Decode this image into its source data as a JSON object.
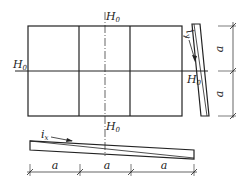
{
  "diagram": {
    "type": "drainage-slope-plan",
    "labels": {
      "axis_top": "H",
      "axis_top_sub": "0",
      "axis_left": "H",
      "axis_left_sub": "0",
      "axis_right": "H",
      "axis_right_sub": "0",
      "axis_bottom": "H",
      "axis_bottom_sub": "0",
      "slope_y": "i",
      "slope_y_sub": "y",
      "slope_x": "i",
      "slope_x_sub": "x"
    },
    "dimensions": {
      "vertical": [
        "a",
        "a"
      ],
      "horizontal": [
        "a",
        "a",
        "a"
      ]
    },
    "colors": {
      "line": "#222222",
      "background": "#ffffff"
    }
  }
}
